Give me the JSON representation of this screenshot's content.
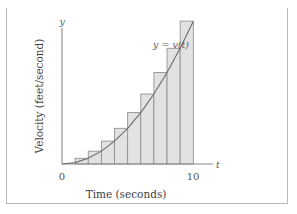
{
  "figure": {
    "frame_visible": true,
    "background_color": "#ffffff",
    "border_color": "#b8b8b8"
  },
  "axes": {
    "y_axis_symbol": "y",
    "x_axis_symbol": "t",
    "x_title": "Time (seconds)",
    "y_title": "Velocity (feet/second)",
    "x_ticks": [
      "0",
      "10"
    ]
  },
  "curve": {
    "label": "y = v(t)",
    "color": "#6e6e6e"
  },
  "bars": {
    "fill_color": "#e2e2e2",
    "stroke_color": "#8f8f8f"
  },
  "chart_data": {
    "type": "bar",
    "title": "",
    "subtitle": "",
    "xlabel": "Time (seconds)",
    "ylabel": "Velocity (feet/second)",
    "xlim": [
      0,
      11.5
    ],
    "ylim": [
      0,
      105
    ],
    "grid": false,
    "legend": "none",
    "annotations": [
      {
        "text": "y = v(t)",
        "x": 8.2,
        "y": 86,
        "italic": true
      }
    ],
    "axis_symbols": {
      "x": "t",
      "y": "y"
    },
    "x_tick_values": [
      0,
      10
    ],
    "x_tick_labels": [
      "0",
      "10"
    ],
    "riemann_sum": {
      "method": "right-endpoint (circumscribed) rectangles",
      "n": 9,
      "interval": [
        1,
        10
      ],
      "bar_width": 1,
      "categories": [
        "1",
        "2",
        "3",
        "4",
        "5",
        "6",
        "7",
        "8",
        "9"
      ],
      "left_edges": [
        1,
        2,
        3,
        4,
        5,
        6,
        7,
        8,
        9
      ],
      "right_edges": [
        2,
        3,
        4,
        5,
        6,
        7,
        8,
        9,
        10
      ],
      "values": [
        4,
        9,
        16,
        25,
        36,
        49,
        64,
        81,
        100
      ]
    },
    "series": [
      {
        "name": "y = v(t)",
        "type": "line",
        "x": [
          0,
          1,
          2,
          3,
          4,
          5,
          6,
          7,
          8,
          9,
          10,
          11
        ],
        "values": [
          0,
          1,
          4,
          9,
          16,
          25,
          36,
          49,
          64,
          81,
          100,
          121
        ]
      }
    ]
  }
}
